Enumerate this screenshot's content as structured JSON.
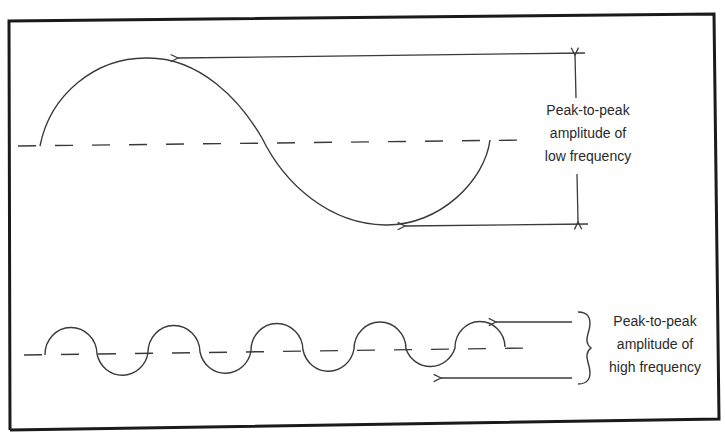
{
  "diagram": {
    "colors": {
      "line": "#3a3a3a",
      "border": "#1a1a1a",
      "text": "#2a2a2a",
      "background": "#ffffff"
    },
    "low_frequency": {
      "label": [
        "Peak-to-peak",
        "amplitude of",
        "low frequency"
      ],
      "wave": "one cycle, large amplitude"
    },
    "high_frequency": {
      "label": [
        "Peak-to-peak",
        "amplitude of",
        "high frequency"
      ],
      "wave": "four-plus cycles, small amplitude"
    }
  }
}
